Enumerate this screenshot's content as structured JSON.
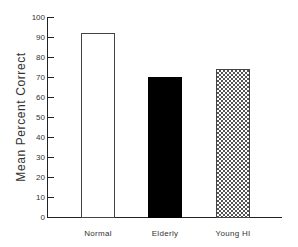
{
  "chart_data": {
    "type": "bar",
    "title": "",
    "xlabel": "",
    "ylabel": "Mean Percent Correct",
    "categories": [
      "Normal",
      "Elderly",
      "Young HI"
    ],
    "values": [
      92,
      70,
      74
    ],
    "fills": [
      "white",
      "black",
      "crosshatch"
    ],
    "ylim": [
      0,
      100
    ],
    "yticks": [
      0,
      10,
      20,
      30,
      40,
      50,
      60,
      70,
      80,
      90,
      100
    ],
    "grid": false,
    "legend": null
  },
  "ylabel": "Mean Percent Correct",
  "yticks": [
    "0",
    "10",
    "20",
    "30",
    "40",
    "50",
    "60",
    "70",
    "80",
    "90",
    "100"
  ],
  "categories": [
    "Normal",
    "Elderly",
    "Young HI"
  ]
}
